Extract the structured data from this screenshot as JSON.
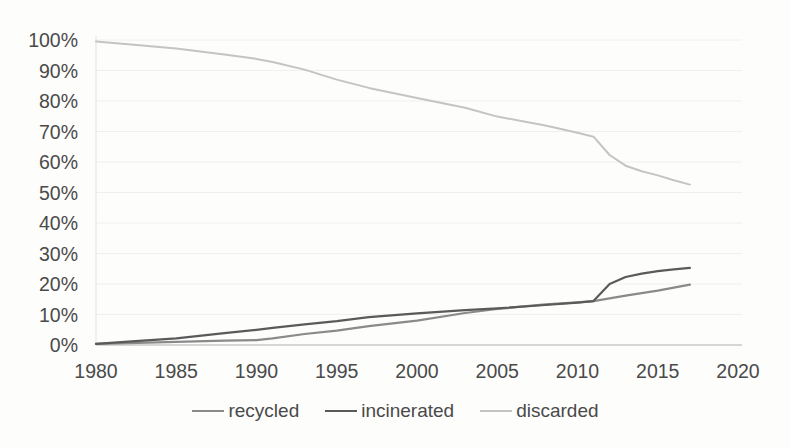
{
  "chart_data": {
    "type": "line",
    "title": "",
    "xlabel": "",
    "ylabel": "",
    "xlim": [
      1980,
      2020
    ],
    "ylim": [
      0,
      100
    ],
    "grid": true,
    "legend_position": "bottom",
    "x_tick_labels": [
      "1980",
      "1985",
      "1990",
      "1995",
      "2000",
      "2005",
      "2010",
      "2015",
      "2020"
    ],
    "x_tick_values": [
      1980,
      1985,
      1990,
      1995,
      2000,
      2005,
      2010,
      2015,
      2020
    ],
    "y_tick_labels": [
      "0%",
      "10%",
      "20%",
      "30%",
      "40%",
      "50%",
      "60%",
      "70%",
      "80%",
      "90%",
      "100%"
    ],
    "y_tick_values": [
      0,
      10,
      20,
      30,
      40,
      50,
      60,
      70,
      80,
      90,
      100
    ],
    "x": [
      1980,
      1982,
      1985,
      1988,
      1990,
      1991,
      1993,
      1995,
      1997,
      2000,
      2003,
      2005,
      2008,
      2010,
      2011,
      2012,
      2013,
      2014,
      2015,
      2016,
      2017
    ],
    "series": [
      {
        "name": "recycled",
        "color": "#8a8a8a",
        "stroke_width": 2.2,
        "values": [
          0.4,
          0.6,
          1.0,
          1.4,
          1.6,
          2.2,
          3.6,
          4.7,
          6.2,
          8.0,
          10.5,
          11.8,
          13.3,
          14.0,
          14.4,
          15.3,
          16.2,
          17.0,
          17.8,
          18.8,
          19.8
        ]
      },
      {
        "name": "incinerated",
        "color": "#5a5a5a",
        "stroke_width": 2.2,
        "values": [
          0.4,
          1.1,
          2.2,
          3.9,
          5.0,
          5.6,
          6.8,
          7.8,
          9.1,
          10.4,
          11.4,
          12.0,
          13.1,
          13.9,
          14.4,
          20.0,
          22.3,
          23.4,
          24.2,
          24.8,
          25.3
        ]
      },
      {
        "name": "discarded",
        "color": "#c4c4c4",
        "stroke_width": 2.0,
        "values": [
          99.5,
          98.6,
          97.2,
          95.2,
          93.8,
          92.8,
          90.3,
          87.0,
          84.3,
          81.0,
          77.8,
          74.9,
          72.0,
          69.6,
          68.3,
          62.3,
          58.8,
          57.0,
          55.6,
          54.0,
          52.6
        ]
      }
    ],
    "colors": {
      "tick_text": "#4a4a4a",
      "axis_line": "#c9c9c7",
      "gridline": "#f0f0ee",
      "background": "#fdfdfc"
    }
  }
}
